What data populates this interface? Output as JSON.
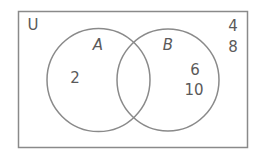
{
  "diagram": {
    "type": "venn",
    "universal_label": "U",
    "colors": {
      "stroke": "#8a8a8a",
      "text": "#5a5a5a",
      "background": "#ffffff"
    },
    "sets": [
      {
        "name": "A",
        "elements_only": [
          "2"
        ]
      },
      {
        "name": "B",
        "elements_only": [
          "6",
          "10"
        ]
      }
    ],
    "intersection": [],
    "outside": [
      "4",
      "8"
    ],
    "labels": {
      "u": "U",
      "a": "A",
      "b": "B",
      "a_only_1": "2",
      "b_only_1": "6",
      "b_only_2": "10",
      "outside_1": "4",
      "outside_2": "8"
    }
  }
}
